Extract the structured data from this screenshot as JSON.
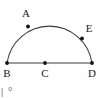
{
  "figure": {
    "background_color": "#ffffff",
    "stroke_color": "#3a3a3a",
    "point_color": "#111111",
    "label_color": "#1a1a1a",
    "shape": "semicircle",
    "arc": {
      "center_x": 49.5,
      "center_y": 63,
      "radius": 43,
      "start_angle_deg": 180,
      "end_angle_deg": 0,
      "apex_y": 20
    },
    "diameter_segment": {
      "from": "B",
      "to": "D",
      "y": 63
    },
    "points": [
      {
        "label": "A",
        "x": 28,
        "y": 26.5,
        "on": "arc",
        "label_x": 26,
        "label_y": 17
      },
      {
        "label": "E",
        "x": 82,
        "y": 38.5,
        "on": "arc",
        "label_x": 89,
        "label_y": 32
      },
      {
        "label": "B",
        "x": 7,
        "y": 63,
        "on": "diameter-endpoint",
        "label_x": 7,
        "label_y": 77
      },
      {
        "label": "C",
        "x": 45,
        "y": 63,
        "on": "diameter-center",
        "label_x": 45,
        "label_y": 77
      },
      {
        "label": "D",
        "x": 92,
        "y": 63,
        "on": "diameter-endpoint",
        "label_x": 92,
        "label_y": 77
      }
    ],
    "footer_artifact": {
      "bar": "|",
      "glyph": "°"
    }
  }
}
